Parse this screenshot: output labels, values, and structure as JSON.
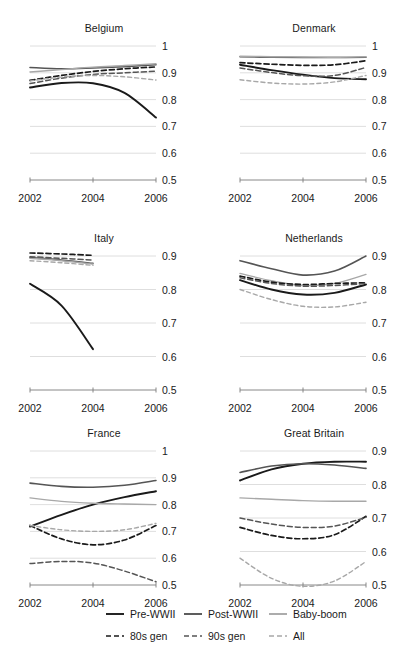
{
  "chart_data": {
    "type": "line",
    "title": "",
    "xlabel": "",
    "ylabel": "",
    "grid": true,
    "legend_position": "bottom",
    "x": [
      2002,
      2003,
      2004,
      2005,
      2006
    ],
    "xticks": [
      "2002",
      "2004",
      "2006"
    ],
    "xlim": [
      2002,
      2006
    ],
    "series_names": [
      "Pre-WWII",
      "Post-WWII",
      "Baby-boom",
      "80s gen",
      "90s gen",
      "All"
    ],
    "panels": [
      {
        "name": "Belgium",
        "ylim": [
          0.5,
          1.0
        ],
        "yticks": [
          "1",
          "0.9",
          "0.8",
          "0.7",
          "0.6",
          "0.5"
        ],
        "ytickvals": [
          1.0,
          0.9,
          0.8,
          0.7,
          0.6,
          0.5
        ],
        "series": [
          {
            "name": "Pre-WWII",
            "values": [
              0.845,
              0.862,
              0.861,
              0.825,
              0.733
            ]
          },
          {
            "name": "Post-WWII",
            "values": [
              0.92,
              0.915,
              0.918,
              0.923,
              0.93
            ]
          },
          {
            "name": "Baby-boom",
            "values": [
              0.903,
              0.912,
              0.921,
              0.927,
              0.934
            ]
          },
          {
            "name": "80s gen",
            "values": [
              0.872,
              0.89,
              0.905,
              0.915,
              0.922
            ]
          },
          {
            "name": "90s gen",
            "values": [
              0.86,
              0.88,
              0.894,
              0.9,
              0.906
            ]
          },
          {
            "name": "All",
            "values": [
              0.87,
              0.884,
              0.89,
              0.885,
              0.873
            ]
          }
        ]
      },
      {
        "name": "Denmark",
        "ylim": [
          0.5,
          1.0
        ],
        "yticks": [
          "1",
          "0.9",
          "0.8",
          "0.7",
          "0.6",
          "0.5"
        ],
        "ytickvals": [
          1.0,
          0.9,
          0.8,
          0.7,
          0.6,
          0.5
        ],
        "series": [
          {
            "name": "Pre-WWII",
            "values": [
              0.93,
              0.91,
              0.893,
              0.88,
              0.876
            ]
          },
          {
            "name": "Post-WWII",
            "values": [
              0.96,
              0.958,
              0.957,
              0.957,
              0.958
            ]
          },
          {
            "name": "Baby-boom",
            "values": [
              0.962,
              0.96,
              0.959,
              0.958,
              0.96
            ]
          },
          {
            "name": "80s gen",
            "values": [
              0.938,
              0.932,
              0.928,
              0.93,
              0.945
            ]
          },
          {
            "name": "90s gen",
            "values": [
              0.918,
              0.901,
              0.889,
              0.89,
              0.92
            ]
          },
          {
            "name": "All",
            "values": [
              0.874,
              0.862,
              0.858,
              0.866,
              0.89
            ]
          }
        ]
      },
      {
        "name": "Italy",
        "ylim": [
          0.5,
          0.9
        ],
        "yticks": [
          "0.9",
          "0.8",
          "0.7",
          "0.6",
          "0.5"
        ],
        "ytickvals": [
          0.9,
          0.8,
          0.7,
          0.6,
          0.5
        ],
        "xmax_data": 2004,
        "series": [
          {
            "name": "Pre-WWII",
            "values": [
              0.817,
              0.752,
              0.622
            ]
          },
          {
            "name": "Post-WWII",
            "values": [
              0.895,
              0.888,
              0.878
            ]
          },
          {
            "name": "Baby-boom",
            "values": [
              0.893,
              0.886,
              0.876
            ]
          },
          {
            "name": "80s gen",
            "values": [
              0.909,
              0.906,
              0.902
            ]
          },
          {
            "name": "90s gen",
            "values": [
              0.898,
              0.893,
              0.888
            ]
          },
          {
            "name": "All",
            "values": [
              0.886,
              0.88,
              0.872
            ]
          }
        ]
      },
      {
        "name": "Netherlands",
        "ylim": [
          0.5,
          0.9
        ],
        "yticks": [
          "0.9",
          "0.8",
          "0.7",
          "0.6",
          "0.5"
        ],
        "ytickvals": [
          0.9,
          0.8,
          0.7,
          0.6,
          0.5
        ],
        "series": [
          {
            "name": "Pre-WWII",
            "values": [
              0.828,
              0.8,
              0.785,
              0.79,
              0.815
            ]
          },
          {
            "name": "Post-WWII",
            "values": [
              0.886,
              0.862,
              0.843,
              0.855,
              0.9
            ]
          },
          {
            "name": "Baby-boom",
            "values": [
              0.848,
              0.826,
              0.812,
              0.818,
              0.845
            ]
          },
          {
            "name": "80s gen",
            "values": [
              0.84,
              0.822,
              0.815,
              0.818,
              0.82
            ]
          },
          {
            "name": "90s gen",
            "values": [
              0.835,
              0.818,
              0.81,
              0.812,
              0.818
            ]
          },
          {
            "name": "All",
            "values": [
              0.8,
              0.77,
              0.75,
              0.748,
              0.762
            ]
          }
        ]
      },
      {
        "name": "France",
        "ylim": [
          0.5,
          1.0
        ],
        "yticks": [
          "1",
          "0.9",
          "0.8",
          "0.7",
          "0.6",
          "0.5"
        ],
        "ytickvals": [
          1.0,
          0.9,
          0.8,
          0.7,
          0.6,
          0.5
        ],
        "series": [
          {
            "name": "Pre-WWII",
            "values": [
              0.718,
              0.762,
              0.8,
              0.828,
              0.85
            ]
          },
          {
            "name": "Post-WWII",
            "values": [
              0.88,
              0.868,
              0.865,
              0.872,
              0.89
            ]
          },
          {
            "name": "Baby-boom",
            "values": [
              0.825,
              0.812,
              0.805,
              0.802,
              0.8
            ]
          },
          {
            "name": "80s gen",
            "values": [
              0.722,
              0.672,
              0.65,
              0.668,
              0.722
            ]
          },
          {
            "name": "90s gen",
            "values": [
              0.58,
              0.588,
              0.582,
              0.552,
              0.512
            ]
          },
          {
            "name": "All",
            "values": [
              0.722,
              0.706,
              0.7,
              0.706,
              0.73
            ]
          }
        ]
      },
      {
        "name": "Great Britain",
        "ylim": [
          0.5,
          0.9
        ],
        "yticks": [
          "0.9",
          "0.8",
          "0.7",
          "0.6",
          "0.5"
        ],
        "ytickvals": [
          0.9,
          0.8,
          0.7,
          0.6,
          0.5
        ],
        "series": [
          {
            "name": "Pre-WWII",
            "values": [
              0.812,
              0.845,
              0.862,
              0.868,
              0.868
            ]
          },
          {
            "name": "Post-WWII",
            "values": [
              0.836,
              0.855,
              0.862,
              0.858,
              0.848
            ]
          },
          {
            "name": "Baby-boom",
            "values": [
              0.76,
              0.756,
              0.752,
              0.75,
              0.75
            ]
          },
          {
            "name": "80s gen",
            "values": [
              0.672,
              0.648,
              0.638,
              0.65,
              0.705
            ]
          },
          {
            "name": "90s gen",
            "values": [
              0.7,
              0.682,
              0.672,
              0.676,
              0.702
            ]
          },
          {
            "name": "All",
            "values": [
              0.58,
              0.52,
              0.496,
              0.512,
              0.57
            ]
          }
        ]
      }
    ]
  },
  "legend": {
    "items": [
      {
        "label": "Pre-WWII",
        "color": "#1a1a1a",
        "style": "solid"
      },
      {
        "label": "Post-WWII",
        "color": "#555555",
        "style": "solid"
      },
      {
        "label": "Baby-boom",
        "color": "#a8a8a8",
        "style": "solid"
      },
      {
        "label": "80s gen",
        "color": "#1a1a1a",
        "style": "dashed"
      },
      {
        "label": "90s gen",
        "color": "#555555",
        "style": "dashed"
      },
      {
        "label": "All",
        "color": "#a8a8a8",
        "style": "dashed"
      }
    ]
  },
  "colors": {
    "pre_wwii": "#1a1a1a",
    "post_wwii": "#555555",
    "baby_boom": "#a8a8a8",
    "gen80s": "#1a1a1a",
    "gen90s": "#555555",
    "all": "#a8a8a8",
    "gridline": "#d6d6d6",
    "axis": "#7a7a7a",
    "text": "#1a1a1a"
  }
}
